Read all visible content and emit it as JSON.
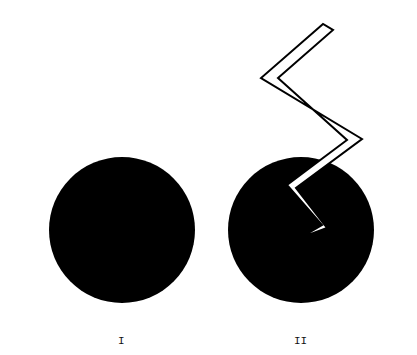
{
  "figures": [
    {
      "id": "I",
      "label": "I",
      "description": "solid black circle"
    },
    {
      "id": "II",
      "label": "II",
      "description": "solid black circle with outlined zigzag lightning strike penetrating it"
    }
  ],
  "colors": {
    "fill": "#000000",
    "background": "#ffffff"
  }
}
